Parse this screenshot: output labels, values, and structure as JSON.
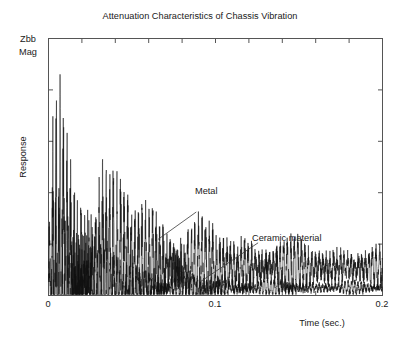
{
  "chart_data": {
    "type": "line",
    "title": "Attenuation Characteristics of Chassis Vibration",
    "xlabel": "Time (sec.)",
    "ylabel": "Response",
    "corner_label_line1": "Zbb",
    "corner_label_line2": "Mag",
    "xlim": [
      0,
      0.2
    ],
    "ylim": [
      0,
      1
    ],
    "xticks": [
      0,
      0.02,
      0.04,
      0.06,
      0.08,
      0.1,
      0.12,
      0.14,
      0.16,
      0.18,
      0.2
    ],
    "xtick_labels": [
      "0",
      "0.1",
      "0.2"
    ],
    "xtick_label_values": [
      0,
      0.1,
      0.2
    ],
    "yticks": [
      0,
      0.2,
      0.4,
      0.6,
      0.8,
      1.0
    ],
    "ytick_labels": [],
    "grid": false,
    "legend": "none",
    "frame_color": "#555555",
    "trace_color": "#111111",
    "background": "#ffffff",
    "annotations": [
      {
        "label": "Metal",
        "text_x": 0.0895,
        "text_y": 0.345,
        "leader_from_x": 0.0885,
        "leader_from_y": 0.325,
        "leader_to_x": 0.0655,
        "leader_to_y": 0.218
      },
      {
        "label": "Ceramic material",
        "text_x": 0.126,
        "text_y": 0.225,
        "leader_from_x": 0.1255,
        "leader_from_y": 0.205,
        "leader_to_x": 0.0908,
        "leader_to_y": 0.053
      }
    ],
    "series": [
      {
        "name": "Metal",
        "description": "Slowly decaying oscillatory vibration response of the metal chassis",
        "envelope_peak_time": 0.0055,
        "envelope_peak_value": 0.78,
        "decay_time_constant": 0.062,
        "residual_level": 0.055,
        "envelope_x": [
          0,
          0.0025,
          0.0055,
          0.009,
          0.014,
          0.02,
          0.027,
          0.035,
          0.044,
          0.054,
          0.065,
          0.077,
          0.09,
          0.104,
          0.119,
          0.135,
          0.152,
          0.17,
          0.185,
          0.2
        ],
        "envelope_y": [
          0.1,
          0.55,
          0.78,
          0.73,
          0.64,
          0.555,
          0.475,
          0.405,
          0.345,
          0.295,
          0.25,
          0.212,
          0.18,
          0.155,
          0.133,
          0.116,
          0.102,
          0.092,
          0.086,
          0.082
        ]
      },
      {
        "name": "Ceramic material",
        "description": "Rapidly attenuated vibration response of the ceramic-damped chassis",
        "envelope_peak_time": 0.004,
        "envelope_peak_value": 0.42,
        "decay_time_constant": 0.029,
        "residual_level": 0.018,
        "envelope_x": [
          0,
          0.002,
          0.004,
          0.007,
          0.011,
          0.016,
          0.022,
          0.029,
          0.037,
          0.046,
          0.056,
          0.067,
          0.079,
          0.092,
          0.106,
          0.121,
          0.137,
          0.154,
          0.172,
          0.2
        ],
        "envelope_y": [
          0.08,
          0.3,
          0.42,
          0.395,
          0.345,
          0.295,
          0.245,
          0.2,
          0.16,
          0.125,
          0.098,
          0.077,
          0.06,
          0.048,
          0.04,
          0.034,
          0.03,
          0.027,
          0.025,
          0.024
        ]
      }
    ]
  }
}
